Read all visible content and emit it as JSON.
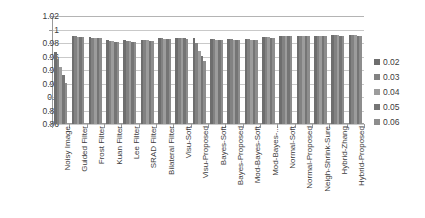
{
  "chart_data": {
    "type": "bar",
    "title": "",
    "xlabel": "",
    "ylabel": "",
    "ylim": [
      0.86,
      1.02
    ],
    "yticks": [
      "1.02",
      "1",
      "0.98",
      "0.96",
      "0.94",
      "0.92",
      "0.9",
      "0.88",
      "0.86"
    ],
    "grid": true,
    "legend_position": "right",
    "legend_title": "",
    "categories": [
      "Noisy Image",
      "Guided Filter",
      "Frost Filter",
      "Kuan Filter",
      "Lee Filter",
      "SRAD Filter",
      "Bilateral Filter",
      "Visu-Soft",
      "Visu-Proposed",
      "Bayes-Soft",
      "Bayes-Proposed",
      "Mod-Bayes-Soft",
      "Mod-Bayes-...",
      "Normal-Soft",
      "Normal-Proposed",
      "Neigh-Shrink-Sure",
      "Hybrid-Zhang",
      "Hybrid-Proposed"
    ],
    "series": [
      {
        "name": "0.02",
        "color": "#6e6e6e",
        "values": [
          0.966,
          0.99,
          0.989,
          0.984,
          0.984,
          0.985,
          0.987,
          0.988,
          0.988,
          0.986,
          0.986,
          0.986,
          0.989,
          0.991,
          0.991,
          0.991,
          0.992,
          0.992
        ]
      },
      {
        "name": "0.03",
        "color": "#828282",
        "values": [
          0.956,
          0.99,
          0.988,
          0.983,
          0.983,
          0.984,
          0.987,
          0.988,
          0.98,
          0.986,
          0.986,
          0.986,
          0.989,
          0.991,
          0.991,
          0.991,
          0.992,
          0.992
        ]
      },
      {
        "name": "0.04",
        "color": "#9c9c9c",
        "values": [
          0.944,
          0.989,
          0.988,
          0.983,
          0.983,
          0.984,
          0.986,
          0.987,
          0.968,
          0.985,
          0.985,
          0.985,
          0.989,
          0.991,
          0.991,
          0.991,
          0.992,
          0.992
        ]
      },
      {
        "name": "0.05",
        "color": "#757575",
        "values": [
          0.933,
          0.989,
          0.987,
          0.982,
          0.982,
          0.983,
          0.986,
          0.987,
          0.961,
          0.985,
          0.985,
          0.985,
          0.988,
          0.99,
          0.99,
          0.99,
          0.991,
          0.991
        ]
      },
      {
        "name": "0.06",
        "color": "#8d8d8d",
        "values": [
          0.921,
          0.989,
          0.987,
          0.982,
          0.982,
          0.983,
          0.986,
          0.986,
          0.954,
          0.984,
          0.984,
          0.984,
          0.988,
          0.99,
          0.99,
          0.99,
          0.991,
          0.991
        ]
      }
    ]
  }
}
